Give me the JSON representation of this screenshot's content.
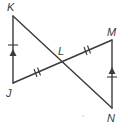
{
  "diagram": {
    "type": "geometry-figure",
    "points": {
      "K": {
        "label": "K",
        "x": 13,
        "y": 16
      },
      "J": {
        "label": "J",
        "x": 13,
        "y": 83
      },
      "L": {
        "label": "L",
        "x": 62,
        "y": 62
      },
      "M": {
        "label": "M",
        "x": 112,
        "y": 40
      },
      "N": {
        "label": "N",
        "x": 112,
        "y": 108
      }
    },
    "segments": [
      {
        "from": "K",
        "to": "J",
        "marks": [
          "single-tick",
          "parallel-arrow"
        ]
      },
      {
        "from": "K",
        "to": "N",
        "marks": []
      },
      {
        "from": "J",
        "to": "M",
        "marks": []
      },
      {
        "from": "M",
        "to": "N",
        "marks": [
          "single-tick",
          "parallel-arrow"
        ]
      }
    ],
    "congruence_marks": [
      {
        "segment": "JL",
        "type": "double-tick"
      },
      {
        "segment": "LM",
        "type": "double-tick"
      },
      {
        "segment": "KJ",
        "type": "single-tick"
      },
      {
        "segment": "MN",
        "type": "single-tick"
      }
    ],
    "parallel_marks": [
      {
        "segment": "KJ",
        "type": "arrow-up"
      },
      {
        "segment": "MN",
        "type": "arrow-up"
      }
    ],
    "labels": {
      "K": "K",
      "J": "J",
      "L": "L",
      "M": "M",
      "N": "N"
    },
    "colors": {
      "stroke": "#3a3a3a",
      "background": "#ffffff"
    }
  }
}
